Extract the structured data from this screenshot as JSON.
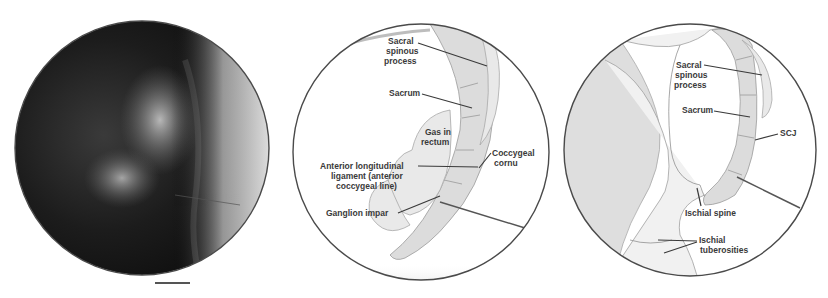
{
  "figure": {
    "panels": [
      {
        "id": "fluoroscopy",
        "kind": "radiograph",
        "labels": []
      },
      {
        "id": "lateral-diagram-ganglion-impar",
        "kind": "illustration",
        "labels": [
          {
            "key": "sacral_spinous",
            "lines": [
              "Sacral",
              "spinous",
              "process"
            ]
          },
          {
            "key": "sacrum",
            "lines": [
              "Sacrum"
            ]
          },
          {
            "key": "gas_rectum",
            "lines": [
              "Gas in",
              "rectum"
            ]
          },
          {
            "key": "coccygeal_cornu",
            "lines": [
              "Coccygeal",
              "cornu"
            ]
          },
          {
            "key": "anterior_ligament",
            "lines": [
              "Anterior longitudinal",
              "ligament (anterior",
              "coccygeal line)"
            ]
          },
          {
            "key": "ganglion_impar",
            "lines": [
              "Ganglion impar"
            ]
          }
        ]
      },
      {
        "id": "lateral-diagram-pelvis",
        "kind": "illustration",
        "labels": [
          {
            "key": "sacral_spinous",
            "lines": [
              "Sacral",
              "spinous",
              "process"
            ]
          },
          {
            "key": "sacrum",
            "lines": [
              "Sacrum"
            ]
          },
          {
            "key": "scj",
            "lines": [
              "SCJ"
            ]
          },
          {
            "key": "ischial_spine",
            "lines": [
              "Ischial spine"
            ]
          },
          {
            "key": "ischial_tuberosities",
            "lines": [
              "Ischial",
              "tuberosities"
            ]
          }
        ]
      }
    ]
  }
}
